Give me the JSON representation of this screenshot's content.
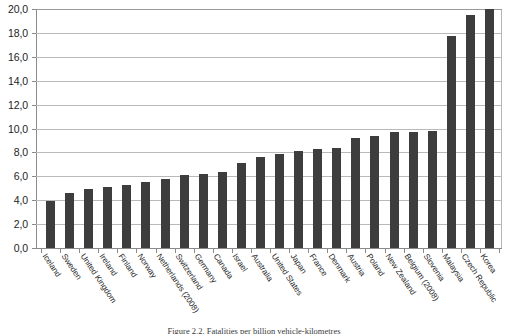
{
  "chart_data": {
    "type": "bar",
    "title": "",
    "xlabel": "",
    "ylabel": "",
    "ylim": [
      0,
      20
    ],
    "ytick_step": 2,
    "grid": true,
    "legend": "none",
    "decimal_separator": ",",
    "bar_color": "#3d3d3d",
    "gridline_color": "#b9b9b9",
    "axis_color": "#8a8a8a",
    "ytick_labels": [
      "20,0",
      "18,0",
      "16,0",
      "14,0",
      "12,0",
      "10,0",
      "8,0",
      "6,0",
      "4,0",
      "2,0",
      "0,0"
    ],
    "ytick_values": [
      20,
      18,
      16,
      14,
      12,
      10,
      8,
      6,
      4,
      2,
      0
    ],
    "categories": [
      "Iceland",
      "Sweden",
      "United Kingdom",
      "Ireland",
      "Finland",
      "Norway",
      "Netherlands (2008)",
      "Switzerland",
      "Germany",
      "Canada",
      "Israel",
      "Australia",
      "United States",
      "Japan",
      "France",
      "Denmark",
      "Austria",
      "Poland",
      "New Zealand",
      "Belgium (2008)",
      "Slovenia",
      "Malaysia",
      "Czech Republic",
      "Korea"
    ],
    "values": [
      3.9,
      4.6,
      4.9,
      5.1,
      5.3,
      5.5,
      5.8,
      6.1,
      6.2,
      6.4,
      7.1,
      7.6,
      7.9,
      8.1,
      8.3,
      8.4,
      9.2,
      9.4,
      9.7,
      9.7,
      9.8,
      17.7,
      19.5,
      20.0
    ]
  },
  "caption": {
    "text": "Figure 2.2. Fatalities per billion vehicle-kilometres"
  }
}
